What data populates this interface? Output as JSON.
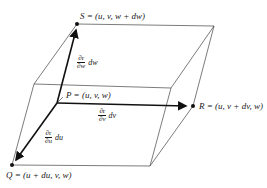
{
  "diagram": {
    "points": {
      "S": {
        "label": "S = (u, v, w + dw)",
        "x": 77,
        "y": 24
      },
      "P": {
        "label": "P = (u, v, w)",
        "x": 57,
        "y": 103
      },
      "R": {
        "label": "R = (u, v + dv, w)",
        "x": 193,
        "y": 106
      },
      "Q": {
        "label": "Q = (u + du, v, w)",
        "x": 12,
        "y": 165
      }
    },
    "vectors": {
      "w": {
        "numerator": "∂r",
        "denominator": "∂w",
        "tail": "dw"
      },
      "v": {
        "numerator": "∂r",
        "denominator": "∂v",
        "tail": "dv"
      },
      "u": {
        "numerator": "∂r",
        "denominator": "∂u",
        "tail": "du"
      }
    },
    "colors": {
      "line": "#333333",
      "vector": "#111111",
      "background": "#ffffff"
    }
  }
}
